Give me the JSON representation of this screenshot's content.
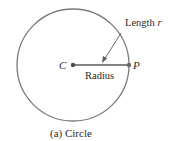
{
  "diagram": {
    "caption": "(a) Circle",
    "center_label": "C",
    "point_label": "P",
    "radius_label": "Radius",
    "length_label_prefix": "Length ",
    "length_label_var": "r",
    "colors": {
      "stroke": "#7a7a7a",
      "radius_line": "#5a5a5a",
      "text": "#2a2a2a",
      "background": "#ffffff"
    },
    "geometry": {
      "center": [
        73,
        65
      ],
      "radius": 56,
      "point_p": [
        129,
        65
      ]
    }
  }
}
